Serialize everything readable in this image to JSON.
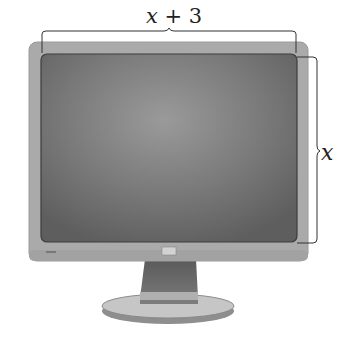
{
  "diagram": {
    "width_label": {
      "variable": "x",
      "operator": "+",
      "constant": "3",
      "text": "x + 3"
    },
    "height_label": {
      "variable": "x",
      "text": "x"
    },
    "colors": {
      "bezel": "#a9a9a9",
      "screen": "#6e6e6e",
      "screen_highlight": "#9a9a9a",
      "stand": "#6a6a6a",
      "base": "#c4c4c4",
      "brace": "#333333"
    }
  }
}
